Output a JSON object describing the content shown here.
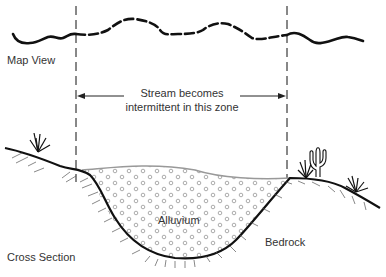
{
  "labels": {
    "map_view": "Map View",
    "cross_section": "Cross Section",
    "zone_line1": "Stream becomes",
    "zone_line2": "intermittent in this zone",
    "alluvium": "Alluvium",
    "bedrock": "Bedrock"
  },
  "colors": {
    "stroke": "#111111",
    "text": "#333333",
    "water_surface": "#999999",
    "pebbles": "#888888",
    "hatch": "#555555"
  }
}
